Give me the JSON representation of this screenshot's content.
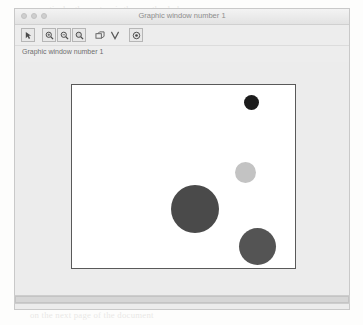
{
  "background_lines": [
    {
      "text": "particular the system is the one the dark",
      "top": 4,
      "left": 38,
      "size": 8.5
    },
    {
      "text": "than on the other hand in the simple case",
      "top": 17,
      "left": 22,
      "size": 8.2
    },
    {
      "text": "not of the contrast of a number and",
      "top": 30,
      "left": 150,
      "size": 8.4
    },
    {
      "text": "where the elements of the solution show",
      "top": 56,
      "left": 30,
      "size": 8.6
    },
    {
      "text": "of the number of the circles drawn and",
      "top": 70,
      "left": 24,
      "size": 8.6
    },
    {
      "text": "shown ab  and the",
      "top": 100,
      "left": 168,
      "size": 9.2
    },
    {
      "text": "n = 1 the fraction on the scale",
      "top": 128,
      "left": 18,
      "size": 9.4
    },
    {
      "text": "plot  in terms of the N = 4  as the",
      "top": 143,
      "left": 14,
      "size": 9.4
    },
    {
      "text": "of  drawing  of the  M = 2   non-zero in",
      "top": 157,
      "left": 14,
      "size": 9.4
    },
    {
      "text": "example   of the   values   all  decrease",
      "top": 172,
      "left": 14,
      "size": 9.4
    },
    {
      "text": "and  the  figure   in  it   and  the  radius",
      "top": 187,
      "left": 14,
      "size": 9.4
    },
    {
      "text": "These  additionally  show  the  area. The",
      "top": 202,
      "left": 14,
      "size": 9.4
    },
    {
      "text": "size of the circle and the proportional",
      "top": 217,
      "left": 14,
      "size": 9.4
    },
    {
      "text": "Scilab   can plot the   circles   as   shown",
      "top": 246,
      "left": 14,
      "size": 9.6
    },
    {
      "text": "where the figure appears in the graphic window",
      "top": 262,
      "left": 14,
      "size": 9.6
    },
    {
      "text": "on the next page of the document",
      "top": 310,
      "left": 30,
      "size": 8.8
    }
  ],
  "window": {
    "title": "Graphic window number 1",
    "traffic_lights": [
      "close-dot",
      "minimize-dot",
      "maximize-dot"
    ],
    "status_label": "Graphic window number 1",
    "chrome_color": "#ececec",
    "titlebar_text_color": "#8d8d8d"
  },
  "toolbar": {
    "groups": [
      {
        "name": "group-select",
        "buttons": [
          {
            "name": "pointer-select-icon",
            "label": "Select"
          }
        ]
      },
      {
        "name": "group-zoom",
        "buttons": [
          {
            "name": "zoom-in-icon",
            "label": "Zoom in"
          },
          {
            "name": "zoom-out-icon",
            "label": "Zoom out"
          },
          {
            "name": "zoom-area-icon",
            "label": "Zoom area"
          }
        ]
      },
      {
        "name": "group-view",
        "buttons": [
          {
            "name": "rotate-3d-icon",
            "label": "Rotate"
          },
          {
            "name": "datatip-icon",
            "label": "Data tip"
          }
        ]
      },
      {
        "name": "group-help",
        "buttons": [
          {
            "name": "help-info-icon",
            "label": "Help"
          }
        ]
      }
    ]
  },
  "scrollbar": {
    "name": "horizontal-scrollbar",
    "thumb_percent": 100
  },
  "chart_data": {
    "type": "scatter",
    "title": "",
    "xlabel": "",
    "ylabel": "",
    "grid": false,
    "legend": null,
    "axis_visible": false,
    "frame": {
      "border_color": "#595959",
      "background": "#ffffff"
    },
    "note": "Bubble plot: four filled circles of differing radius and gray level on a plain white framed canvas.",
    "points": [
      {
        "id": "bubble-1",
        "x_pct": 80.5,
        "y_pct": 9.5,
        "radius_px": 7.5,
        "color": "#1c1c1c",
        "shade": "black"
      },
      {
        "id": "bubble-2",
        "x_pct": 78.0,
        "y_pct": 48.0,
        "radius_px": 10.5,
        "color": "#c3c3c3",
        "shade": "light-gray"
      },
      {
        "id": "bubble-3",
        "x_pct": 55.0,
        "y_pct": 68.0,
        "radius_px": 24.0,
        "color": "#4a4a4a",
        "shade": "dark-gray"
      },
      {
        "id": "bubble-4",
        "x_pct": 83.0,
        "y_pct": 88.0,
        "radius_px": 18.5,
        "color": "#545454",
        "shade": "dark-gray"
      }
    ]
  }
}
